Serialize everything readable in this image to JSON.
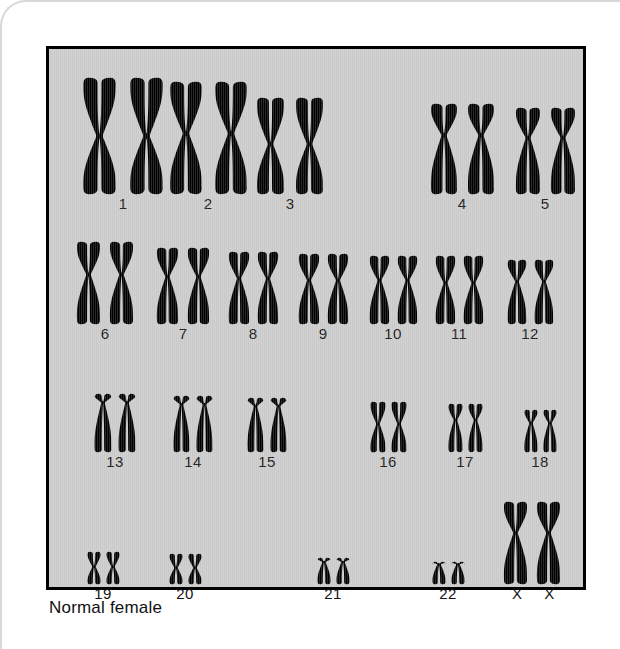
{
  "figure": {
    "caption": "Normal female",
    "panel_bg": "#c9c9c9",
    "chromosome_color": "#000000",
    "border_color": "#000000"
  },
  "chart_data": {
    "type": "diagram",
    "title": "Normal female",
    "subtype": "karyotype",
    "karyotype": "46,XX",
    "total_chromosomes": 46,
    "pair_count": 23,
    "sex_chromosomes": "XX",
    "rows": [
      {
        "row": 1,
        "pairs": [
          {
            "label": "1",
            "morphology": "metacentric",
            "height": 118,
            "arm_ratio": 0.5,
            "x": 118
          },
          {
            "label": "2",
            "morphology": "submetacentric",
            "height": 114,
            "arm_ratio": 0.46,
            "x": 203
          },
          {
            "label": "3",
            "morphology": "metacentric",
            "height": 98,
            "arm_ratio": 0.48,
            "x": 285
          },
          {
            "label": "4",
            "morphology": "submetacentric",
            "height": 92,
            "arm_ratio": 0.35,
            "x": 457
          },
          {
            "label": "5",
            "morphology": "submetacentric",
            "height": 88,
            "arm_ratio": 0.35,
            "x": 540
          }
        ]
      },
      {
        "row": 2,
        "pairs": [
          {
            "label": "6",
            "morphology": "submetacentric",
            "height": 84,
            "arm_ratio": 0.4,
            "x": 100
          },
          {
            "label": "7",
            "morphology": "submetacentric",
            "height": 78,
            "arm_ratio": 0.38,
            "x": 178
          },
          {
            "label": "8",
            "morphology": "submetacentric",
            "height": 74,
            "arm_ratio": 0.37,
            "x": 248
          },
          {
            "label": "9",
            "morphology": "submetacentric",
            "height": 72,
            "arm_ratio": 0.38,
            "x": 318
          },
          {
            "label": "10",
            "morphology": "submetacentric",
            "height": 70,
            "arm_ratio": 0.36,
            "x": 388
          },
          {
            "label": "11",
            "morphology": "submetacentric",
            "height": 70,
            "arm_ratio": 0.4,
            "x": 454
          },
          {
            "label": "12",
            "morphology": "submetacentric",
            "height": 66,
            "arm_ratio": 0.34,
            "x": 525
          }
        ]
      },
      {
        "row": 3,
        "pairs": [
          {
            "label": "13",
            "morphology": "acrocentric",
            "height": 60,
            "arm_ratio": 0.16,
            "x": 110
          },
          {
            "label": "14",
            "morphology": "acrocentric",
            "height": 58,
            "arm_ratio": 0.16,
            "x": 188
          },
          {
            "label": "15",
            "morphology": "acrocentric",
            "height": 56,
            "arm_ratio": 0.16,
            "x": 262
          },
          {
            "label": "16",
            "morphology": "metacentric",
            "height": 52,
            "arm_ratio": 0.44,
            "x": 383
          },
          {
            "label": "17",
            "morphology": "submetacentric",
            "height": 50,
            "arm_ratio": 0.34,
            "x": 460
          },
          {
            "label": "18",
            "morphology": "submetacentric",
            "height": 44,
            "arm_ratio": 0.32,
            "x": 535
          }
        ]
      },
      {
        "row": 4,
        "pairs": [
          {
            "label": "19",
            "morphology": "metacentric",
            "height": 34,
            "arm_ratio": 0.46,
            "x": 98
          },
          {
            "label": "20",
            "morphology": "metacentric",
            "height": 32,
            "arm_ratio": 0.46,
            "x": 180
          },
          {
            "label": "21",
            "morphology": "acrocentric-small",
            "height": 28,
            "arm_ratio": 0.18,
            "x": 328
          },
          {
            "label": "22",
            "morphology": "acrocentric-small",
            "height": 24,
            "arm_ratio": 0.14,
            "x": 443
          },
          {
            "label": "X X",
            "morphology": "submetacentric",
            "height": 84,
            "arm_ratio": 0.38,
            "x": 527,
            "is_sex": true
          }
        ]
      }
    ]
  }
}
